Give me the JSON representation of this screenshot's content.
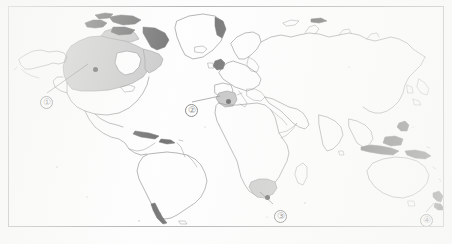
{
  "figure": {
    "kind": "outline world map",
    "background_color": "#fdfdfd",
    "frame_color": "#8e8e8e",
    "coastline_color": "#4f4f4f",
    "highlight_fill": "#b2b2b2",
    "marker_color": "#1b1b1b",
    "label_text_color": "#333333"
  },
  "frame": {
    "x": 8,
    "y": 6,
    "width": 436,
    "height": 221
  },
  "callouts": [
    {
      "id": "callout-1",
      "label": "①",
      "number": "1",
      "region_name": "Canada",
      "label_x": 37,
      "label_y": 95,
      "marker_x": 86,
      "marker_y": 62,
      "leader_from_x": 45,
      "leader_from_y": 92,
      "leader_to_x": 69,
      "leader_to_y": 70
    },
    {
      "id": "callout-2",
      "label": "②",
      "number": "2",
      "region_name": "Mediterranean / Italy",
      "label_x": 182,
      "label_y": 103,
      "marker_x": 219,
      "marker_y": 94,
      "leader_from_x": 190,
      "leader_from_y": 101,
      "leader_to_x": 213,
      "leader_to_y": 95
    },
    {
      "id": "callout-3",
      "label": "③",
      "number": "3",
      "region_name": "South Africa",
      "label_x": 271,
      "label_y": 209,
      "marker_x": 258,
      "marker_y": 190,
      "leader_from_x": 268,
      "leader_from_y": 203,
      "leader_to_x": 259,
      "leader_to_y": 193
    },
    {
      "id": "callout-4",
      "label": "④",
      "number": "4",
      "region_name": "New Zealand",
      "label_x": 417,
      "label_y": 213,
      "marker_x": 431,
      "marker_y": 200,
      "leader_from_x": 424,
      "leader_from_y": 211,
      "leader_to_x": 429,
      "leader_to_y": 203
    }
  ],
  "highlighted_regions": [
    {
      "name": "Canada",
      "fill": "#b2b2b2"
    },
    {
      "name": "Mediterranean patch",
      "fill": "#a8a8a8"
    },
    {
      "name": "South Africa",
      "fill": "#b2b2b2"
    }
  ]
}
